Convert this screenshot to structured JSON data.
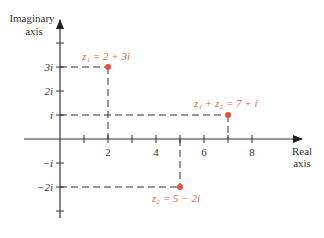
{
  "axes": {
    "imaginary_label_line1": "Imaginary",
    "imaginary_label_line2": "axis",
    "real_label_line1": "Real",
    "real_label_line2": "axis"
  },
  "x_ticks": [
    {
      "value": 2,
      "label": "2"
    },
    {
      "value": 4,
      "label": "4"
    },
    {
      "value": 6,
      "label": "6"
    },
    {
      "value": 8,
      "label": "8"
    }
  ],
  "y_ticks": [
    {
      "value": 3,
      "label": "3i"
    },
    {
      "value": 2,
      "label": "2i"
    },
    {
      "value": 1,
      "label": "i"
    },
    {
      "value": -1,
      "label": "−i"
    },
    {
      "value": -2,
      "label": "−2i"
    }
  ],
  "points": [
    {
      "name": "z1",
      "re": 2,
      "im": 3,
      "label": "z₁ = 2 + 3i"
    },
    {
      "name": "z1-plus-z2",
      "re": 7,
      "im": 1,
      "label": "z₁ + z₂ = 7 + i"
    },
    {
      "name": "z2",
      "re": 5,
      "im": -2,
      "label": "z₂ = 5 − 2i"
    }
  ],
  "colors": {
    "axis": "#333333",
    "point": "#e8503a",
    "point_label": "#e06a4a",
    "dash": "#333333"
  }
}
